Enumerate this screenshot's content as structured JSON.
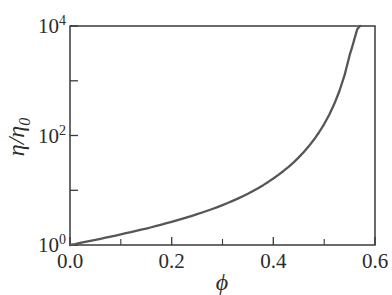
{
  "chart_data": {
    "type": "line",
    "title": "",
    "subtitle": "",
    "xlabel": "ϕ",
    "ylabel": "η/η",
    "ylabel_sub": "0",
    "xlim": [
      0.0,
      0.6
    ],
    "ylim": [
      1,
      10000
    ],
    "yscale": "log",
    "xscale": "linear",
    "grid": false,
    "legend": null,
    "xticks": [
      0.0,
      0.1,
      0.2,
      0.3,
      0.4,
      0.5,
      0.6
    ],
    "xticklabels": [
      "0.0",
      "",
      "0.2",
      "",
      "0.4",
      "",
      "0.6"
    ],
    "yticks": [
      1,
      10,
      100,
      1000,
      10000
    ],
    "yticklabels": [
      "10",
      "",
      "10",
      "",
      "10"
    ],
    "yticklabel_exponents": [
      "0",
      "",
      "2",
      "",
      "4"
    ],
    "y_labeled_ticks": [
      {
        "value": 1,
        "mantissa": "10",
        "exponent": "0"
      },
      {
        "value": 100,
        "mantissa": "10",
        "exponent": "2"
      },
      {
        "value": 10000,
        "mantissa": "10",
        "exponent": "4"
      }
    ],
    "series": [
      {
        "name": "relative viscosity",
        "color": "#565656",
        "x": [
          0.0,
          0.01,
          0.02,
          0.03,
          0.04,
          0.05,
          0.06,
          0.07,
          0.08,
          0.09,
          0.1,
          0.11,
          0.12,
          0.13,
          0.14,
          0.15,
          0.16,
          0.17,
          0.18,
          0.19,
          0.2,
          0.21,
          0.22,
          0.23,
          0.24,
          0.25,
          0.26,
          0.27,
          0.28,
          0.29,
          0.3,
          0.31,
          0.32,
          0.33,
          0.34,
          0.35,
          0.36,
          0.37,
          0.38,
          0.39,
          0.4,
          0.41,
          0.42,
          0.43,
          0.44,
          0.45,
          0.46,
          0.47,
          0.48,
          0.49,
          0.5,
          0.51,
          0.52,
          0.53,
          0.54,
          0.55,
          0.555,
          0.56,
          0.565,
          0.57,
          0.572,
          0.574,
          0.576,
          0.578,
          0.579,
          0.58
        ],
        "y": [
          1.0,
          1.04,
          1.09,
          1.14,
          1.19,
          1.24,
          1.3,
          1.36,
          1.42,
          1.49,
          1.56,
          1.64,
          1.72,
          1.81,
          1.9,
          2.0,
          2.11,
          2.23,
          2.36,
          2.5,
          2.65,
          2.81,
          2.99,
          3.19,
          3.41,
          3.65,
          3.92,
          4.22,
          4.55,
          4.93,
          5.36,
          5.84,
          6.4,
          7.04,
          7.79,
          8.66,
          9.69,
          10.9,
          12.4,
          14.2,
          16.4,
          19.1,
          22.5,
          26.8,
          32.4,
          39.8,
          49.9,
          64.0,
          84.3,
          114.6,
          162.0,
          240.0,
          379.0,
          650.0,
          1250.0,
          2900.0,
          4100.0,
          6000.0,
          8700.0,
          9900.0,
          10000.0,
          10000.0,
          10000.0,
          10000.0,
          10000.0,
          10000.0
        ]
      }
    ],
    "annotations": []
  },
  "figure": {
    "background_color": "#ffffff",
    "axis_color": "#3a3a3a",
    "curve_color": "#565656"
  }
}
